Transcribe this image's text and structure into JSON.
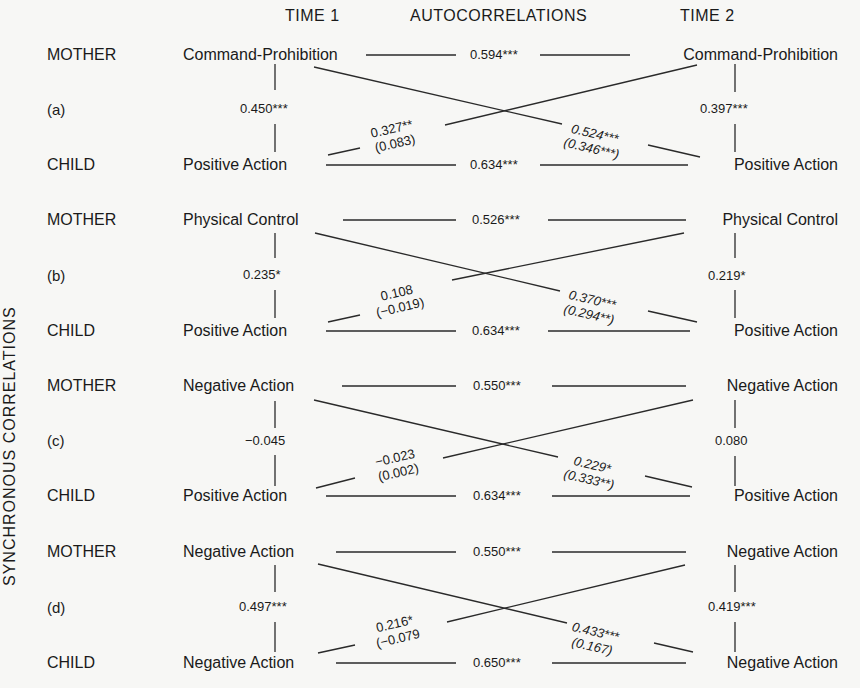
{
  "header": {
    "time1": "TIME 1",
    "autocorrelations": "AUTOCORRELATIONS",
    "time2": "TIME 2"
  },
  "side_label": "SYNCHRONOUS CORRELATIONS",
  "panels": [
    {
      "tag": "(a)",
      "mother_role": "MOTHER",
      "child_role": "CHILD",
      "mother_t1": "Command-Prohibition",
      "mother_t2": "Command-Prohibition",
      "child_t1": "Positive Action",
      "child_t2": "Positive Action",
      "auto_mother": "0.594***",
      "auto_child": "0.634***",
      "sync_t1": "0.450***",
      "sync_t2": "0.397***",
      "cross_child_to_mother": "0.327**",
      "cross_child_to_mother_partial": "(0.083)",
      "cross_mother_to_child": "0.524***",
      "cross_mother_to_child_partial": "(0.346***)"
    },
    {
      "tag": "(b)",
      "mother_role": "MOTHER",
      "child_role": "CHILD",
      "mother_t1": "Physical Control",
      "mother_t2": "Physical Control",
      "child_t1": "Positive Action",
      "child_t2": "Positive Action",
      "auto_mother": "0.526***",
      "auto_child": "0.634***",
      "sync_t1": "0.235*",
      "sync_t2": "0.219*",
      "cross_child_to_mother": "0.108",
      "cross_child_to_mother_partial": "(−0.019)",
      "cross_mother_to_child": "0.370***",
      "cross_mother_to_child_partial": "(0.294**)"
    },
    {
      "tag": "(c)",
      "mother_role": "MOTHER",
      "child_role": "CHILD",
      "mother_t1": "Negative Action",
      "mother_t2": "Negative Action",
      "child_t1": "Positive Action",
      "child_t2": "Positive Action",
      "auto_mother": "0.550***",
      "auto_child": "0.634***",
      "sync_t1": "−0.045",
      "sync_t2": "0.080",
      "cross_child_to_mother": "−0.023",
      "cross_child_to_mother_partial": "(0.002)",
      "cross_mother_to_child": "0.229*",
      "cross_mother_to_child_partial": "(0.333**)"
    },
    {
      "tag": "(d)",
      "mother_role": "MOTHER",
      "child_role": "CHILD",
      "mother_t1": "Negative Action",
      "mother_t2": "Negative Action",
      "child_t1": "Negative Action",
      "child_t2": "Negative Action",
      "auto_mother": "0.550***",
      "auto_child": "0.650***",
      "sync_t1": "0.497***",
      "sync_t2": "0.419***",
      "cross_child_to_mother": "0.216*",
      "cross_child_to_mother_partial": "(−0.079",
      "cross_mother_to_child": "0.433***",
      "cross_mother_to_child_partial": "(0.167)"
    }
  ],
  "colors": {
    "background": "#f7f7f5",
    "ink": "#1a1a1a"
  }
}
